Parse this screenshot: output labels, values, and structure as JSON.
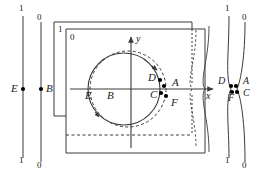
{
  "figure": {
    "axes": {
      "x_label": "x",
      "y_label": "y"
    },
    "left_lines": [
      {
        "name": "line-1",
        "top_label": "1",
        "bottom_label": "1",
        "point_label": "E"
      },
      {
        "name": "line-0",
        "top_label": "0",
        "bottom_label": "0",
        "point_label": "B"
      }
    ],
    "right_lines": [
      {
        "name": "line-1",
        "top_label": "1",
        "bottom_label": "1"
      },
      {
        "name": "line-0",
        "top_label": "0",
        "bottom_label": "0"
      }
    ],
    "right_point_labels": [
      "D",
      "A",
      "F",
      "C"
    ],
    "rectangles": [
      {
        "name": "rect-back",
        "label": "1"
      },
      {
        "name": "rect-front",
        "label": "0"
      }
    ],
    "circle_points": [
      "D",
      "A",
      "C",
      "F",
      "E",
      "B"
    ],
    "point_labels": {
      "A": "A",
      "B": "B",
      "C": "C",
      "D": "D",
      "E": "E",
      "F": "F"
    },
    "colors": {
      "stroke": "#3a3a3a",
      "dot": "#000000",
      "text": "#1a1a1a",
      "background": "#ffffff"
    }
  }
}
